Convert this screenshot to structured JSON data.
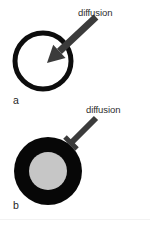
{
  "figure": {
    "background_color": "#ffffff",
    "width": 150,
    "height": 226
  },
  "panels": [
    {
      "id": "a",
      "panel_label": "a",
      "annotation_label": "diffusion",
      "shape": "hollow-ring",
      "connector": "arrow-into-circle",
      "outline_color": "#0d0d0d",
      "fill_color": "#ffffff",
      "stroke_width": 5,
      "circle": {
        "cx": 43,
        "cy": 61,
        "r": 28
      },
      "arrow": {
        "tail_x": 96,
        "tail_y": 17,
        "tip_x": 47,
        "tip_y": 63,
        "color": "#3b3b3b",
        "shaft_width": 7,
        "head_width": 18,
        "head_length": 17
      }
    },
    {
      "id": "b",
      "panel_label": "b",
      "annotation_label": "diffusion",
      "shape": "filled-disk-with-core",
      "connector": "blunt-end-bar",
      "shell_color": "#070707",
      "core_color": "#c6c6c6",
      "disk": {
        "cx": 48,
        "cy": 171,
        "r": 34
      },
      "core": {
        "cx": 48,
        "cy": 171,
        "r": 19
      },
      "bar": {
        "tail_x": 96,
        "tail_y": 118,
        "tip_x": 71,
        "tip_y": 143,
        "color": "#3b3b3b",
        "shaft_width": 6,
        "cap_width": 17,
        "cap_thickness": 5
      }
    }
  ],
  "colors": {
    "ink": "#0d0d0d",
    "connector_gray": "#3b3b3b",
    "core_gray": "#c6c6c6",
    "text": "#2e2e2e",
    "background": "#ffffff"
  }
}
